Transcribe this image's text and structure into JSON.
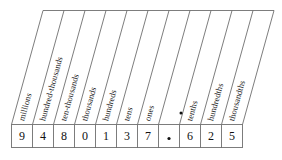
{
  "chart_data": {
    "type": "table",
    "columns": [
      "millions",
      "hundred-thousands",
      "ten-thousands",
      "thousands",
      "hundreds",
      "tens",
      "ones",
      ".",
      "tenths",
      "hundredths",
      "thousandths"
    ],
    "values": [
      "9",
      "4",
      "8",
      "0",
      "1",
      "3",
      "7",
      ".",
      "6",
      "2",
      "5"
    ],
    "number": "9480137.625",
    "decimal_point_index": 7,
    "grid": true,
    "legend": "none",
    "xlabel": "",
    "ylabel": ""
  },
  "chart": {
    "headers": [
      {
        "label": "millions",
        "is_dot": false
      },
      {
        "label": "hundred-thousands",
        "is_dot": false
      },
      {
        "label": "ten-thousands",
        "is_dot": false
      },
      {
        "label": "thousands",
        "is_dot": false
      },
      {
        "label": "hundreds",
        "is_dot": false
      },
      {
        "label": "tens",
        "is_dot": false
      },
      {
        "label": "ones",
        "is_dot": false
      },
      {
        "label": "",
        "is_dot": true
      },
      {
        "label": "tenths",
        "is_dot": false
      },
      {
        "label": "hundredths",
        "is_dot": false
      },
      {
        "label": "thousandths",
        "is_dot": false
      }
    ],
    "digits": [
      {
        "value": "9",
        "is_dot": false
      },
      {
        "value": "4",
        "is_dot": false
      },
      {
        "value": "8",
        "is_dot": false
      },
      {
        "value": "0",
        "is_dot": false
      },
      {
        "value": "1",
        "is_dot": false
      },
      {
        "value": "3",
        "is_dot": false
      },
      {
        "value": "7",
        "is_dot": false
      },
      {
        "value": "",
        "is_dot": true
      },
      {
        "value": "6",
        "is_dot": false
      },
      {
        "value": "2",
        "is_dot": false
      },
      {
        "value": "5",
        "is_dot": false
      }
    ]
  },
  "colors": {
    "border": "#6e6e6e",
    "text": "#111111",
    "background": "#ffffff"
  }
}
